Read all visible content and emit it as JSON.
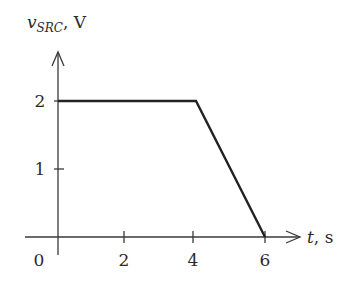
{
  "chart_data": {
    "type": "line",
    "title": "",
    "xlabel": "t, s",
    "ylabel": "v_SRC, V",
    "ylabel_parts": {
      "symbol": "v",
      "subscript": "SRC",
      "unit": ", V"
    },
    "xlabel_parts": {
      "symbol": "t",
      "unit": ", s"
    },
    "x_ticks": [
      0,
      2,
      4,
      6
    ],
    "x_tick_labels": [
      "0",
      "2",
      "4",
      "6"
    ],
    "y_ticks": [
      1,
      2
    ],
    "y_tick_labels": [
      "1",
      "2"
    ],
    "xlim": [
      0,
      6
    ],
    "ylim": [
      0,
      2
    ],
    "grid": false,
    "legend": "none",
    "series": [
      {
        "name": "v_SRC",
        "x": [
          0,
          4,
          6
        ],
        "y": [
          2,
          2,
          0
        ],
        "color": "#222222"
      }
    ]
  }
}
